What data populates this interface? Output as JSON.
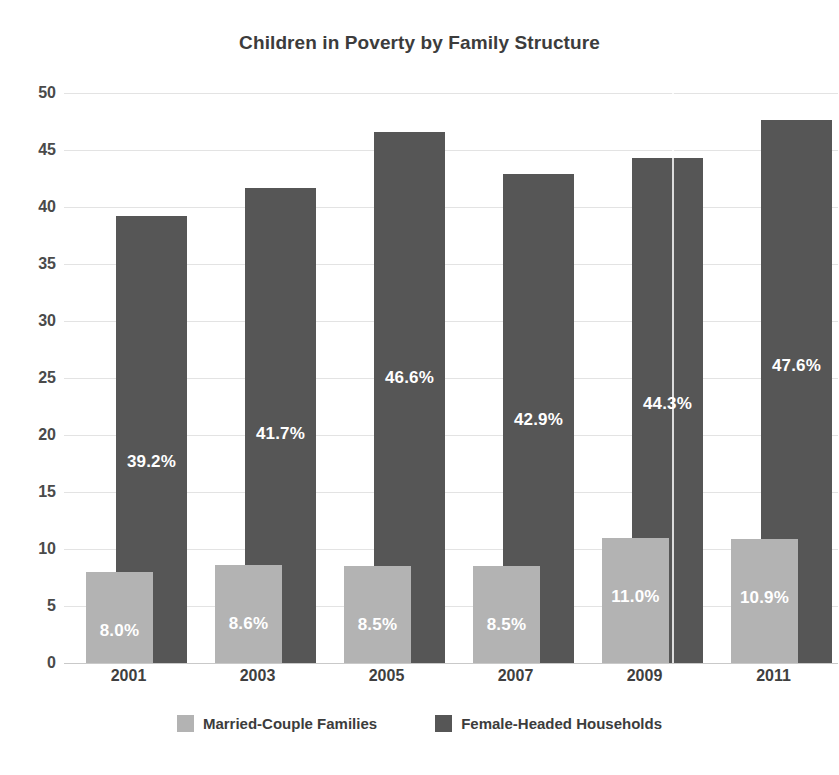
{
  "chart_data": {
    "type": "bar",
    "title": "Children in Poverty by Family Structure",
    "xlabel": "",
    "ylabel": "",
    "ylim": [
      0,
      50
    ],
    "yticks": [
      0,
      5,
      10,
      15,
      20,
      25,
      30,
      35,
      40,
      45,
      50
    ],
    "ytick_labels": [
      "0",
      "5",
      "10",
      "15",
      "20",
      "25",
      "30",
      "35",
      "40",
      "45",
      "50"
    ],
    "grid": true,
    "legend_position": "bottom",
    "categories": [
      "2001",
      "2003",
      "2005",
      "2007",
      "2009",
      "2011"
    ],
    "series": [
      {
        "name": "Married-Couple Families",
        "color": "#b3b3b3",
        "values": [
          8.0,
          8.6,
          8.5,
          8.5,
          11.0,
          10.9
        ],
        "labels": [
          "8.0%",
          "8.6%",
          "8.5%",
          "8.5%",
          "11.0%",
          "10.9%"
        ]
      },
      {
        "name": "Female-Headed Households",
        "color": "#565656",
        "values": [
          39.2,
          41.7,
          46.6,
          42.9,
          44.3,
          47.6
        ],
        "labels": [
          "39.2%",
          "41.7%",
          "46.6%",
          "42.9%",
          "44.3%",
          "47.6%"
        ]
      }
    ]
  },
  "legend": {
    "items": [
      {
        "label": "Married-Couple Families",
        "swatch": "light"
      },
      {
        "label": "Female-Headed Households",
        "swatch": "dark"
      }
    ]
  },
  "colors": {
    "married_couple": "#b3b3b3",
    "female_headed": "#565656",
    "gridline": "#e3e3e3",
    "text": "#3c3c3c",
    "background": "#ffffff"
  }
}
